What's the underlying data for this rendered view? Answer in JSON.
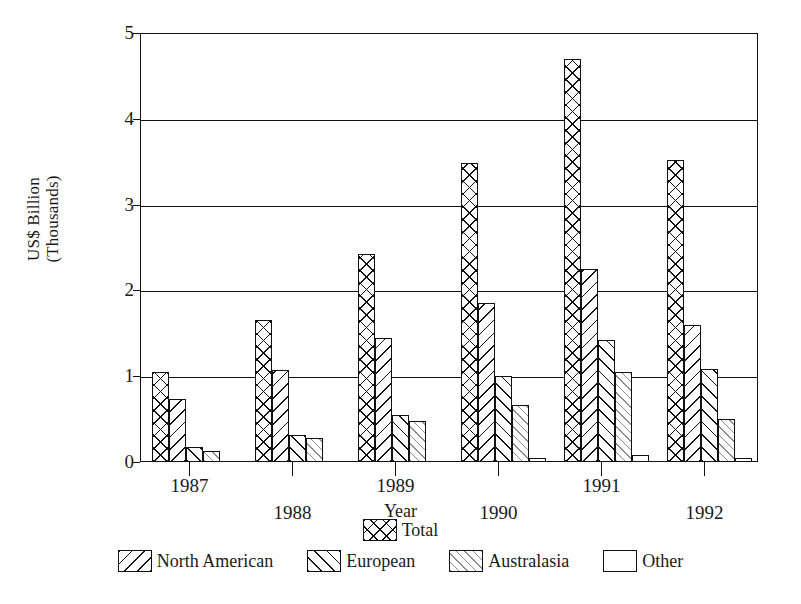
{
  "chart_data": {
    "type": "bar",
    "title": "",
    "xlabel": "Year",
    "ylabel": "US$ Billion\n(Thousands)",
    "ylim": [
      0,
      5
    ],
    "yticks": [
      "0",
      "1",
      "2",
      "3",
      "4",
      "5"
    ],
    "grid": true,
    "legend_position": "bottom",
    "categories": [
      "1987",
      "1988",
      "1989",
      "1990",
      "1991",
      "1992"
    ],
    "series": [
      {
        "name": "Total",
        "pattern": "crosshatch",
        "values": [
          1.05,
          1.65,
          2.42,
          3.48,
          4.7,
          3.52
        ]
      },
      {
        "name": "North American",
        "pattern": "backslash-hatch",
        "values": [
          0.73,
          1.07,
          1.45,
          1.85,
          2.25,
          1.6
        ]
      },
      {
        "name": "European",
        "pattern": "forward-hatch",
        "values": [
          0.17,
          0.32,
          0.55,
          1.0,
          1.42,
          1.08
        ]
      },
      {
        "name": "Australasia",
        "pattern": "light-diagonal",
        "values": [
          0.13,
          0.28,
          0.48,
          0.67,
          1.05,
          0.5
        ]
      },
      {
        "name": "Other",
        "pattern": "empty",
        "values": [
          null,
          null,
          null,
          0.05,
          0.08,
          0.05
        ]
      }
    ]
  },
  "legend": {
    "top_row": [
      {
        "label": "Total",
        "swatch": "crosshatch"
      }
    ],
    "bottom_row": [
      {
        "label": "North American",
        "swatch": "backslash-hatch"
      },
      {
        "label": "European",
        "swatch": "forward-hatch"
      },
      {
        "label": "Australasia",
        "swatch": "light-diagonal"
      },
      {
        "label": "Other",
        "swatch": "empty"
      }
    ]
  }
}
